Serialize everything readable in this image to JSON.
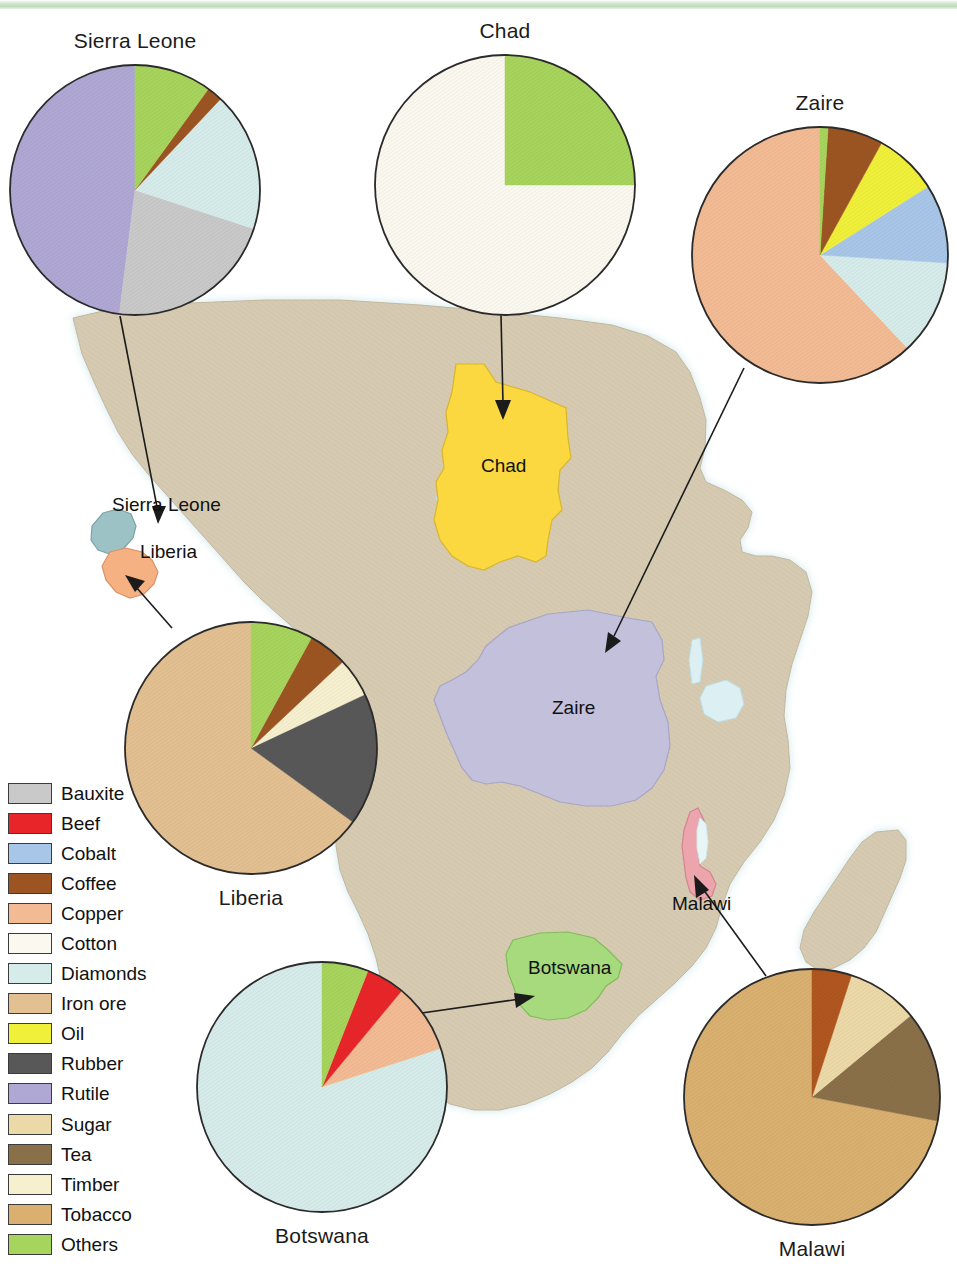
{
  "page": {
    "background_color": "#ffffff",
    "top_band_color": "#bcdcb9"
  },
  "legend": {
    "title": "Commodities",
    "items": [
      {
        "label": "Bauxite",
        "color": "#c9c9c9"
      },
      {
        "label": "Beef",
        "color": "#e8262a"
      },
      {
        "label": "Cobalt",
        "color": "#a8c6e8"
      },
      {
        "label": "Coffee",
        "color": "#9c5522"
      },
      {
        "label": "Copper",
        "color": "#f2bb94"
      },
      {
        "label": "Cotton",
        "color": "#faf8ef"
      },
      {
        "label": "Diamonds",
        "color": "#d6ecea"
      },
      {
        "label": "Iron ore",
        "color": "#e3c091"
      },
      {
        "label": "Oil",
        "color": "#f0f03a"
      },
      {
        "label": "Rubber",
        "color": "#585858"
      },
      {
        "label": "Rutile",
        "color": "#b0a8d4"
      },
      {
        "label": "Sugar",
        "color": "#ecd9a8"
      },
      {
        "label": "Tea",
        "color": "#8a7049"
      },
      {
        "label": "Timber",
        "color": "#f7f0cf"
      },
      {
        "label": "Tobacco",
        "color": "#d9b06f"
      },
      {
        "label": "Others",
        "color": "#a7d45c"
      }
    ]
  },
  "map": {
    "land_color": "#d6cbb2",
    "ocean_color": "#ffffff",
    "coast_halo_color": "#d8ecef",
    "lake_color": "#dceff3",
    "country_labels": [
      {
        "name": "Sierra Leone",
        "text": "Sierra Leone",
        "x": 112,
        "y": 505
      },
      {
        "name": "Liberia",
        "text": "Liberia",
        "x": 140,
        "y": 552
      },
      {
        "name": "Chad",
        "text": "Chad",
        "x": 481,
        "y": 465
      },
      {
        "name": "Zaire",
        "text": "Zaire",
        "x": 552,
        "y": 707
      },
      {
        "name": "Malawi",
        "text": "Malawi",
        "x": 672,
        "y": 903
      },
      {
        "name": "Botswana",
        "text": "Botswana",
        "x": 528,
        "y": 967
      }
    ],
    "highlighted_countries": [
      {
        "name": "Sierra Leone",
        "color": "#9dc2c6"
      },
      {
        "name": "Liberia",
        "color": "#f6b183"
      },
      {
        "name": "Chad",
        "color": "#fbd83f"
      },
      {
        "name": "Zaire",
        "color": "#c3c0dc"
      },
      {
        "name": "Malawi",
        "color": "#eda5ad"
      },
      {
        "name": "Botswana",
        "color": "#a6da7c"
      }
    ]
  },
  "chart_data": [
    {
      "type": "pie",
      "title": "Sierra Leone",
      "title_position": "above",
      "center_x": 135,
      "center_y": 190,
      "radius": 125,
      "start_angle": 0,
      "legend_position": "shared-left",
      "categories": [
        "Rutile",
        "Bauxite",
        "Diamonds",
        "Coffee",
        "Others"
      ],
      "values": [
        48,
        22,
        18,
        2,
        10
      ],
      "colors": [
        "#b0a8d4",
        "#c9c9c9",
        "#d6ecea",
        "#9c5522",
        "#a7d45c"
      ]
    },
    {
      "type": "pie",
      "title": "Chad",
      "title_position": "above",
      "center_x": 505,
      "center_y": 185,
      "radius": 130,
      "start_angle": 0,
      "legend_position": "shared-left",
      "categories": [
        "Cotton",
        "Others"
      ],
      "values": [
        75,
        25
      ],
      "colors": [
        "#faf8ef",
        "#a7d45c"
      ]
    },
    {
      "type": "pie",
      "title": "Zaire",
      "title_position": "above",
      "center_x": 820,
      "center_y": 255,
      "radius": 128,
      "start_angle": 0,
      "legend_position": "shared-left",
      "categories": [
        "Copper",
        "Diamonds",
        "Cobalt",
        "Oil",
        "Coffee",
        "Others"
      ],
      "values": [
        62,
        12,
        10,
        8,
        7,
        1
      ],
      "colors": [
        "#f2bb94",
        "#d6ecea",
        "#a8c6e8",
        "#f0f03a",
        "#9c5522",
        "#a7d45c"
      ]
    },
    {
      "type": "pie",
      "title": "Liberia",
      "title_position": "below",
      "center_x": 251,
      "center_y": 748,
      "radius": 126,
      "start_angle": 0,
      "legend_position": "shared-left",
      "categories": [
        "Iron ore",
        "Rubber",
        "Timber",
        "Coffee",
        "Others"
      ],
      "values": [
        65,
        17,
        5,
        5,
        8
      ],
      "colors": [
        "#e3c091",
        "#585858",
        "#f7f0cf",
        "#9c5522",
        "#a7d45c"
      ]
    },
    {
      "type": "pie",
      "title": "Botswana",
      "title_position": "below",
      "center_x": 322,
      "center_y": 1087,
      "radius": 125,
      "start_angle": 0,
      "legend_position": "shared-left",
      "categories": [
        "Diamonds",
        "Copper",
        "Beef",
        "Others"
      ],
      "values": [
        80,
        9,
        5,
        6
      ],
      "colors": [
        "#d6ecea",
        "#f2bb94",
        "#e8262a",
        "#a7d45c"
      ]
    },
    {
      "type": "pie",
      "title": "Malawi",
      "title_position": "below",
      "center_x": 812,
      "center_y": 1097,
      "radius": 128,
      "start_angle": 0,
      "legend_position": "shared-left",
      "categories": [
        "Tobacco",
        "Tea",
        "Sugar",
        "Coffee"
      ],
      "values": [
        72,
        14,
        9,
        5
      ],
      "colors": [
        "#d9b06f",
        "#8a7049",
        "#ecd9a8",
        "#b0561f"
      ]
    }
  ],
  "leader_lines": [
    {
      "name": "sierra-leone-leader",
      "from_x": 120,
      "from_y": 316,
      "to_x": 160,
      "to_y": 520
    },
    {
      "name": "chad-leader",
      "from_x": 501,
      "from_y": 315,
      "to_x": 505,
      "to_y": 420
    },
    {
      "name": "zaire-leader",
      "from_x": 744,
      "from_y": 368,
      "to_x": 610,
      "to_y": 645
    },
    {
      "name": "liberia-leader",
      "from_x": 172,
      "from_y": 628,
      "to_x": 128,
      "to_y": 578
    },
    {
      "name": "botswana-leader",
      "from_x": 420,
      "from_y": 1013,
      "to_x": 530,
      "to_y": 997
    },
    {
      "name": "malawi-leader",
      "from_x": 764,
      "from_y": 975,
      "to_x": 697,
      "to_y": 880
    }
  ]
}
